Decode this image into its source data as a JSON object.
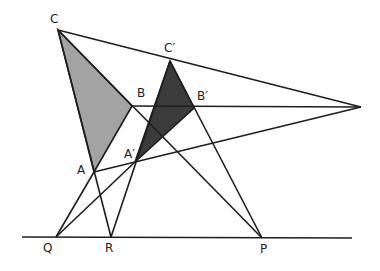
{
  "diagram": {
    "colors": {
      "line": "#1e1e1e",
      "triangle_abc_fill": "#a3a3a3",
      "triangle_abc_prime_fill": "#3b3b3b",
      "background": "#ffffff"
    },
    "points": {
      "C": {
        "label": "C",
        "x": 58,
        "y": 30,
        "lx": 50,
        "ly": 13
      },
      "C'": {
        "label": "C′",
        "x": 170,
        "y": 61,
        "lx": 164,
        "ly": 42
      },
      "B": {
        "label": "B",
        "x": 132,
        "y": 106,
        "lx": 137,
        "ly": 87
      },
      "B'": {
        "label": "B′",
        "x": 194,
        "y": 108,
        "lx": 197,
        "ly": 90
      },
      "A": {
        "label": "A",
        "x": 94,
        "y": 172,
        "lx": 77,
        "ly": 164
      },
      "A'": {
        "label": "A′",
        "x": 135,
        "y": 162,
        "lx": 124,
        "ly": 148
      },
      "O": {
        "label": "",
        "x": 361,
        "y": 107
      },
      "Q": {
        "label": "Q",
        "x": 56,
        "y": 237,
        "lx": 43,
        "ly": 242
      },
      "R": {
        "label": "R",
        "x": 111,
        "y": 237,
        "lx": 105,
        "ly": 242
      },
      "P": {
        "label": "P",
        "x": 262,
        "y": 238,
        "lx": 260,
        "ly": 243
      }
    },
    "axis_line": {
      "x1": 22,
      "y1": 237,
      "x2": 352,
      "y2": 238
    },
    "segments": [
      [
        "C",
        "O"
      ],
      [
        "B",
        "O"
      ],
      [
        "A",
        "O"
      ],
      [
        "C",
        "R"
      ],
      [
        "C",
        "P"
      ],
      [
        "A",
        "Q"
      ],
      [
        "C'",
        "R"
      ],
      [
        "C'",
        "P"
      ],
      [
        "A'",
        "Q"
      ]
    ],
    "triangles": [
      {
        "name": "ABC",
        "vertices": [
          "A",
          "B",
          "C"
        ]
      },
      {
        "name": "A'B'C'",
        "vertices": [
          "A'",
          "B'",
          "C'"
        ]
      }
    ]
  }
}
